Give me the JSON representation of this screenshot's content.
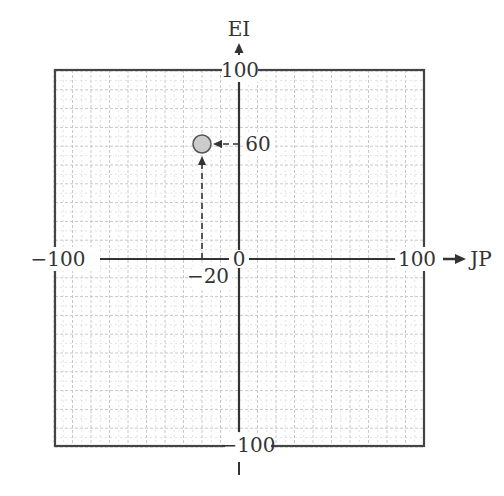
{
  "diagram": {
    "type": "scatter",
    "title": "",
    "x_axis": {
      "label": "JP",
      "min": -100,
      "max": 100,
      "tick_labels": {
        "min": "−100",
        "zero": "0",
        "max": "100"
      }
    },
    "y_axis": {
      "label": "EI",
      "min": -100,
      "max": 100,
      "tick_labels": {
        "min": "−100",
        "max": "100"
      }
    },
    "grid": {
      "on": true,
      "step": 10,
      "minor_step": 5
    },
    "point": {
      "x": -20,
      "y": 60,
      "x_label": "−20",
      "y_label": "60",
      "fill": "#cccccc",
      "stroke": "#555555"
    },
    "colors": {
      "axis": "#333333",
      "frame": "#444444",
      "grid": "#cfcfcf",
      "text": "#333333"
    }
  },
  "chart_data": {
    "type": "scatter",
    "title": "",
    "xlabel": "JP",
    "ylabel": "EI",
    "xlim": [
      -100,
      100
    ],
    "ylim": [
      -100,
      100
    ],
    "grid": true,
    "points": [
      {
        "x": -20,
        "y": 60
      }
    ],
    "annotations": [
      "−20",
      "60"
    ]
  }
}
